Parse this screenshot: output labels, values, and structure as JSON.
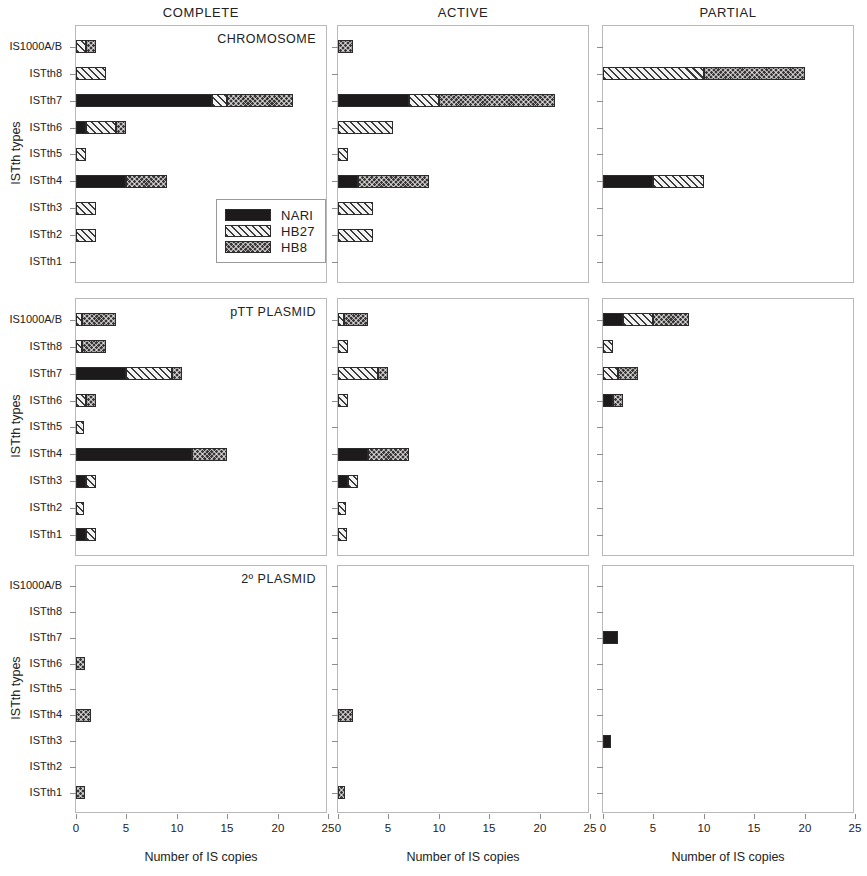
{
  "figure": {
    "column_headers": [
      "COMPLETE",
      "ACTIVE",
      "PARTIAL"
    ],
    "row_titles": [
      "CHROMOSOME",
      "pTT PLASMID",
      "2º PLASMID"
    ],
    "x_axis_title": "Number of  IS copies",
    "y_axis_title": "ISTth types",
    "x_tick_labels": [
      "0",
      "5",
      "10",
      "15",
      "20",
      "25"
    ],
    "y_categories": [
      "IS1000A/B",
      "ISTth8",
      "ISTth7",
      "ISTth6",
      "ISTth5",
      "ISTth4",
      "ISTth3",
      "ISTth2",
      "ISTth1"
    ]
  },
  "legend": {
    "position": "inside-top-left-panel-bottom-right",
    "entries": [
      {
        "label": "NARI",
        "pattern": "solid-black",
        "color": "#1c1a1a"
      },
      {
        "label": "HB27",
        "pattern": "diagonal-hatch",
        "color": "#f2f2f2"
      },
      {
        "label": "HB8",
        "pattern": "cross-checker",
        "color": "#3a3636"
      }
    ]
  },
  "chart_data": {
    "type": "bar",
    "orientation": "horizontal",
    "stacked": true,
    "xlabel": "Number of  IS copies",
    "ylabel": "ISTth types",
    "xlim": [
      0,
      25
    ],
    "xticks": [
      0,
      5,
      10,
      15,
      20,
      25
    ],
    "grid": false,
    "legend": [
      "NARI",
      "HB27",
      "HB8"
    ],
    "categories": [
      "IS1000A/B",
      "ISTth8",
      "ISTth7",
      "ISTth6",
      "ISTth5",
      "ISTth4",
      "ISTth3",
      "ISTth2",
      "ISTth1"
    ],
    "panels": [
      {
        "replicon": "CHROMOSOME",
        "column": "COMPLETE",
        "series": [
          {
            "name": "NARI",
            "values": [
              0,
              0,
              13.5,
              1,
              0,
              5,
              0,
              0,
              0
            ]
          },
          {
            "name": "HB27",
            "values": [
              1,
              3,
              1.5,
              3,
              1,
              0,
              2,
              2,
              0
            ]
          },
          {
            "name": "HB8",
            "values": [
              1,
              0,
              6.5,
              1,
              0,
              4,
              0,
              0,
              0
            ]
          }
        ]
      },
      {
        "replicon": "CHROMOSOME",
        "column": "ACTIVE",
        "series": [
          {
            "name": "NARI",
            "values": [
              0,
              0,
              7,
              0,
              0,
              2,
              0,
              0,
              0
            ]
          },
          {
            "name": "HB27",
            "values": [
              0,
              0,
              3,
              5.5,
              1,
              0,
              3.5,
              3.5,
              0
            ]
          },
          {
            "name": "HB8",
            "values": [
              1.5,
              0,
              11.5,
              0,
              0,
              7,
              0,
              0,
              0
            ]
          }
        ]
      },
      {
        "replicon": "CHROMOSOME",
        "column": "PARTIAL",
        "series": [
          {
            "name": "NARI",
            "values": [
              0,
              0,
              0,
              0,
              0,
              5,
              0,
              0,
              0
            ]
          },
          {
            "name": "HB27",
            "values": [
              0,
              10,
              0,
              0,
              0,
              5,
              0,
              0,
              0
            ]
          },
          {
            "name": "HB8",
            "values": [
              0,
              10,
              0,
              0,
              0,
              0,
              0,
              0,
              0
            ]
          }
        ]
      },
      {
        "replicon": "pTT PLASMID",
        "column": "COMPLETE",
        "series": [
          {
            "name": "NARI",
            "values": [
              0,
              0,
              5,
              0,
              0,
              11.5,
              1,
              0,
              1
            ]
          },
          {
            "name": "HB27",
            "values": [
              0.6,
              0.6,
              4.5,
              1,
              0.8,
              0,
              1,
              0.8,
              1
            ]
          },
          {
            "name": "HB8",
            "values": [
              3.4,
              2.4,
              1,
              1,
              0,
              3.5,
              0,
              0,
              0
            ]
          }
        ]
      },
      {
        "replicon": "pTT PLASMID",
        "column": "ACTIVE",
        "series": [
          {
            "name": "NARI",
            "values": [
              0,
              0,
              0,
              0,
              0,
              3,
              1,
              0,
              0
            ]
          },
          {
            "name": "HB27",
            "values": [
              0.6,
              1,
              4,
              1,
              0,
              0,
              1,
              0.8,
              0.9
            ]
          },
          {
            "name": "HB8",
            "values": [
              2.4,
              0,
              1,
              0,
              0,
              4,
              0,
              0,
              0
            ]
          }
        ]
      },
      {
        "replicon": "pTT PLASMID",
        "column": "PARTIAL",
        "series": [
          {
            "name": "NARI",
            "values": [
              2,
              0,
              0,
              1,
              0,
              0,
              0,
              0,
              0
            ]
          },
          {
            "name": "HB27",
            "values": [
              3,
              1,
              1.5,
              0,
              0,
              0,
              0,
              0,
              0
            ]
          },
          {
            "name": "HB8",
            "values": [
              3.5,
              0,
              2,
              1,
              0,
              0,
              0,
              0,
              0
            ]
          }
        ]
      },
      {
        "replicon": "2º PLASMID",
        "column": "COMPLETE",
        "series": [
          {
            "name": "NARI",
            "values": [
              0,
              0,
              0,
              0,
              0,
              0,
              0,
              0,
              0
            ]
          },
          {
            "name": "HB27",
            "values": [
              0,
              0,
              0,
              0,
              0,
              0,
              0,
              0,
              0
            ]
          },
          {
            "name": "HB8",
            "values": [
              0,
              0,
              0,
              0.9,
              0,
              1.5,
              0,
              0,
              0.9
            ]
          }
        ]
      },
      {
        "replicon": "2º PLASMID",
        "column": "ACTIVE",
        "series": [
          {
            "name": "NARI",
            "values": [
              0,
              0,
              0,
              0,
              0,
              0,
              0,
              0,
              0
            ]
          },
          {
            "name": "HB27",
            "values": [
              0,
              0,
              0,
              0,
              0,
              0,
              0,
              0,
              0
            ]
          },
          {
            "name": "HB8",
            "values": [
              0,
              0,
              0,
              0,
              0,
              1.5,
              0,
              0,
              0.7
            ]
          }
        ]
      },
      {
        "replicon": "2º PLASMID",
        "column": "PARTIAL",
        "series": [
          {
            "name": "NARI",
            "values": [
              0,
              0,
              1.5,
              0,
              0,
              0,
              0.8,
              0,
              0
            ]
          },
          {
            "name": "HB27",
            "values": [
              0,
              0,
              0,
              0,
              0,
              0,
              0,
              0,
              0
            ]
          },
          {
            "name": "HB8",
            "values": [
              0,
              0,
              0,
              0,
              0,
              0,
              0,
              0,
              0
            ]
          }
        ]
      }
    ]
  }
}
